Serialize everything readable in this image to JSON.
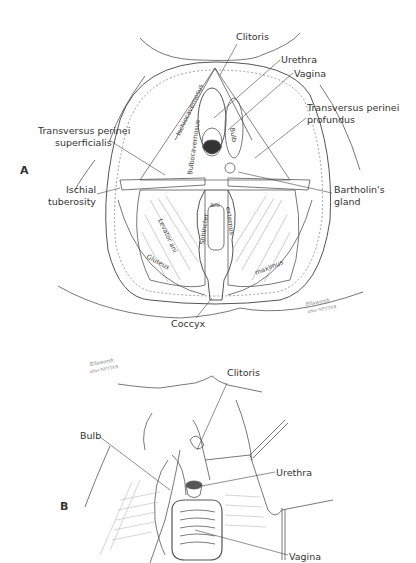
{
  "figure": {
    "panels": [
      {
        "letter": "A",
        "labels": {
          "clitoris": "Clitoris",
          "urethra": "Urethra",
          "vagina": "Vagina",
          "tpp_line1": "Transversus perinei",
          "tpp_line2": "profundus",
          "tps_line1": "Transversus perinei",
          "tps_line2": "superficialis",
          "ischial_line1": "Ischial",
          "ischial_line2": "tuberosity",
          "bartholin_line1": "Bartholin's",
          "bartholin_line2": "gland",
          "coccyx": "Coccyx"
        },
        "muscle_labels": {
          "ischiocavernosus": "Ischiocavernosus",
          "bulbocavernosus": "Bulbocavernosus",
          "bulb": "Bulb",
          "levator_ani": "Levator ani",
          "sphincter": "Sphincter",
          "ani": "ani",
          "externus": "externus",
          "gluteus": "Gluteus",
          "maximus": "maximus"
        },
        "signature": {
          "line1": "Ellsworth",
          "line2": "after NETTER"
        }
      },
      {
        "letter": "B",
        "labels": {
          "clitoris": "Clitoris",
          "bulb": "Bulb",
          "urethra": "Urethra",
          "vagina": "Vagina"
        },
        "signature": {
          "line1": "Ellsworth",
          "line2": "after NETTER"
        }
      }
    ]
  }
}
